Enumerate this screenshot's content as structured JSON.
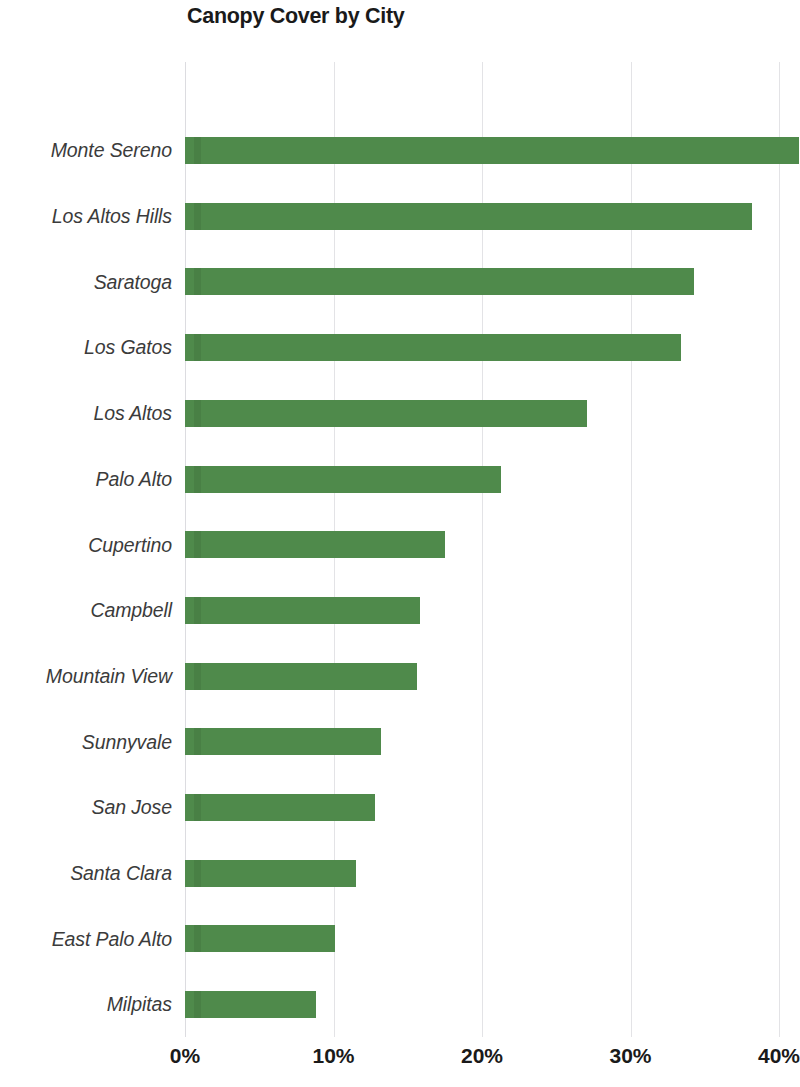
{
  "chart_data": {
    "type": "bar",
    "orientation": "horizontal",
    "title": "Canopy Cover by City",
    "xlabel": "",
    "ylabel": "",
    "xlim": [
      0,
      41.5
    ],
    "grid": true,
    "legend": null,
    "bar_color": "#4f8a4b",
    "gridline_color": "#e3e3e6",
    "xticks": [
      "0%",
      "10%",
      "20%",
      "30%",
      "40%"
    ],
    "xtick_values": [
      0,
      10,
      20,
      30,
      40
    ],
    "categories": [
      "Monte Sereno",
      "Los Altos Hills",
      "Saratoga",
      "Los Gatos",
      "Los Altos",
      "Palo Alto",
      "Cupertino",
      "Campbell",
      "Mountain View",
      "Sunnyvale",
      "San Jose",
      "Santa Clara",
      "East Palo Alto",
      "Milpitas"
    ],
    "values": [
      41.5,
      38.2,
      34.3,
      33.4,
      27.1,
      21.3,
      17.5,
      15.8,
      15.6,
      13.2,
      12.8,
      11.5,
      10.1,
      8.8
    ],
    "value_unit": "%"
  }
}
